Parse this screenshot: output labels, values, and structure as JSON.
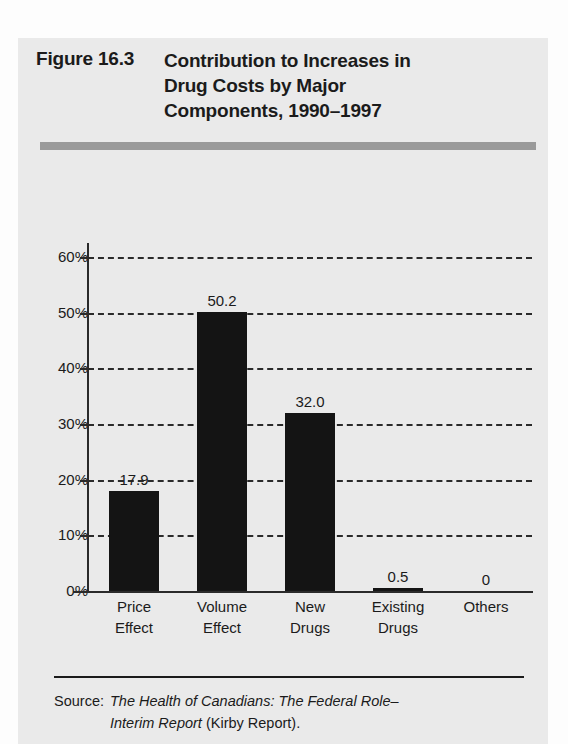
{
  "running_head": "",
  "figure": {
    "number": "Figure 16.3",
    "title_lines": [
      "Contribution to Increases in",
      "Drug Costs by Major",
      "Components, 1990–1997"
    ]
  },
  "source": {
    "label": "Source:",
    "italic_1": "The Health of Canadians: The Federal Role–",
    "italic_2": "Interim Report",
    "plain_2": " (Kirby Report)."
  },
  "colors": {
    "panel_bg": "#eaeaea",
    "bar": "#141414",
    "rule": "#9a9a9a",
    "ink": "#1b1b1b"
  },
  "chart_data": {
    "type": "bar",
    "title": "Contribution to Increases in Drug Costs by Major Components, 1990–1997",
    "xlabel": "",
    "ylabel": "",
    "ylim": [
      0,
      65
    ],
    "grid": true,
    "legend": "none",
    "categories": [
      "Price Effect",
      "Volume Effect",
      "New Drugs",
      "Existing Drugs",
      "Others"
    ],
    "category_lines": [
      [
        "Price",
        "Effect"
      ],
      [
        "Volume",
        "Effect"
      ],
      [
        "New",
        "Drugs"
      ],
      [
        "Existing",
        "Drugs"
      ],
      [
        "Others",
        ""
      ]
    ],
    "values": [
      17.9,
      50.2,
      32.0,
      0.5,
      0
    ],
    "value_labels": [
      "17.9",
      "50.2",
      "32.0",
      "0.5",
      "0"
    ],
    "ytick_values": [
      0,
      10,
      20,
      30,
      40,
      50,
      60
    ],
    "ytick_labels": [
      "0%",
      "10%",
      "20%",
      "30%",
      "40%",
      "50%",
      "60%"
    ]
  }
}
